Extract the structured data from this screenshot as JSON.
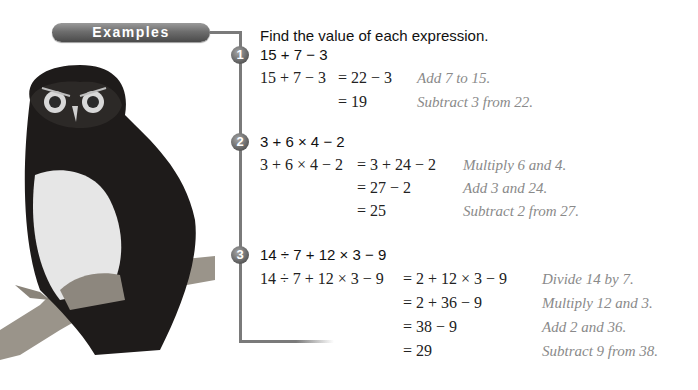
{
  "banner": {
    "label": "Examples"
  },
  "heading": "Find the value of each expression.",
  "examples": [
    {
      "number": "1",
      "problem": "15 + 7 − 3",
      "steps": [
        {
          "left": "15 + 7 − 3",
          "right": "= 22 − 3",
          "note": "Add 7 to 15."
        },
        {
          "left": "",
          "right": "= 19",
          "note": "Subtract 3 from 22."
        }
      ]
    },
    {
      "number": "2",
      "problem": "3 + 6 × 4 − 2",
      "steps": [
        {
          "left": "3 + 6 × 4 − 2",
          "right": "= 3 + 24 − 2",
          "note": "Multiply 6 and 4."
        },
        {
          "left": "",
          "right": "= 27 − 2",
          "note": "Add 3 and 24."
        },
        {
          "left": "",
          "right": "= 25",
          "note": "Subtract 2 from 27."
        }
      ]
    },
    {
      "number": "3",
      "problem": "14 ÷ 7 + 12 × 3 − 9",
      "steps": [
        {
          "left": "14 ÷ 7 + 12 × 3 − 9",
          "right": "= 2 + 12 × 3 − 9",
          "note": "Divide 14 by 7."
        },
        {
          "left": "",
          "right": "= 2 + 36 − 9",
          "note": "Multiply 12 and 3."
        },
        {
          "left": "",
          "right": "= 38 − 9",
          "note": "Add 2 and 36."
        },
        {
          "left": "",
          "right": "= 29",
          "note": "Subtract 9 from 38."
        }
      ]
    }
  ],
  "image": {
    "subject": "owl-on-branch-photo"
  }
}
